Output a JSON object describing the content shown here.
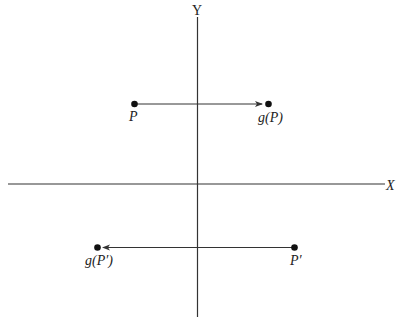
{
  "diagram": {
    "type": "coordinate-plane-mapping",
    "colors": {
      "background": "#ffffff",
      "stroke": "#333333",
      "text": "#222222"
    },
    "axes": {
      "x": {
        "label": "X",
        "x1": 8,
        "x2": 385,
        "y": 184,
        "label_x": 386,
        "label_y": 190
      },
      "y": {
        "label": "Y",
        "x": 197.5,
        "y1": 17,
        "y2": 317,
        "label_x": 192,
        "label_y": 15
      }
    },
    "points": [
      {
        "id": "P",
        "label": "P",
        "cx": 134.5,
        "cy": 104,
        "label_x": 129,
        "label_y": 121
      },
      {
        "id": "gP",
        "label": "g(P)",
        "cx": 268.5,
        "cy": 104,
        "label_x": 258,
        "label_y": 122
      },
      {
        "id": "Pprime",
        "label": "P′",
        "cx": 294.5,
        "cy": 247.5,
        "label_x": 290,
        "label_y": 265
      },
      {
        "id": "gPprime",
        "label": "g(P′)",
        "cx": 97.5,
        "cy": 247.5,
        "label_x": 85,
        "label_y": 265
      }
    ],
    "arrows": [
      {
        "from": "P",
        "to": "gP",
        "direction": "right"
      },
      {
        "from": "Pprime",
        "to": "gPprime",
        "direction": "left"
      }
    ]
  }
}
